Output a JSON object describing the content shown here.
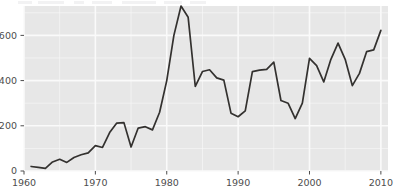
{
  "chart_data": {
    "type": "line",
    "title": "",
    "subtitle": "",
    "xlabel": "",
    "ylabel": "",
    "xlim": [
      1960.0,
      2011.0
    ],
    "ylim": [
      0,
      730
    ],
    "grid": true,
    "legend": null,
    "x_ticks": [
      1960,
      1970,
      1980,
      1990,
      2000,
      2010
    ],
    "x_tick_labels": [
      "1960",
      "1970",
      "1980",
      "1990",
      "2000",
      "2010"
    ],
    "y_ticks": [
      0,
      200,
      400,
      600
    ],
    "y_tick_labels": [
      "0",
      "200",
      "400",
      "600"
    ],
    "series": [
      {
        "name": "series-1",
        "color": "#33312f",
        "x": [
          1961,
          1962,
          1963,
          1964,
          1965,
          1966,
          1967,
          1968,
          1969,
          1970,
          1971,
          1972,
          1973,
          1974,
          1975,
          1976,
          1977,
          1978,
          1979,
          1980,
          1981,
          1982,
          1983,
          1984,
          1985,
          1986,
          1987,
          1988,
          1989,
          1990,
          1991,
          1992,
          1993,
          1994,
          1995,
          1996,
          1997,
          1998,
          1999,
          2000,
          2001,
          2002,
          2003,
          2004,
          2005,
          2006,
          2007,
          2008,
          2009,
          2010
        ],
        "values": [
          20,
          16,
          12,
          40,
          52,
          38,
          60,
          72,
          80,
          112,
          104,
          170,
          212,
          214,
          106,
          190,
          196,
          182,
          260,
          400,
          600,
          730,
          680,
          374,
          440,
          448,
          412,
          402,
          256,
          240,
          266,
          440,
          446,
          450,
          482,
          312,
          300,
          232,
          300,
          498,
          466,
          394,
          494,
          566,
          494,
          378,
          432,
          528,
          536,
          622
        ]
      }
    ]
  },
  "axes": {
    "background_color": "#e7e7e7",
    "gridline_color": "#fafafa",
    "tick_color": "#4d4d4d",
    "label_color": "#4d4d4d"
  }
}
